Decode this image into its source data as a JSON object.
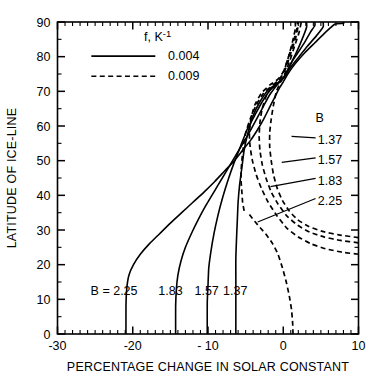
{
  "chart_data": {
    "type": "line",
    "title": "",
    "xlabel": "PERCENTAGE CHANGE IN SOLAR CONSTANT",
    "ylabel": "LATITUDE OF ICE-LINE",
    "xlim": [
      -30,
      10
    ],
    "ylim": [
      0,
      90
    ],
    "xticks": [
      -30,
      -20,
      -10,
      0,
      10
    ],
    "xtick_labels": [
      "-30",
      "-20",
      "- 10",
      "0",
      "10"
    ],
    "yticks": [
      0,
      10,
      20,
      30,
      40,
      50,
      60,
      70,
      80,
      90
    ],
    "ytick_labels": [
      "0",
      "10",
      "20",
      "30",
      "40",
      "50",
      "60",
      "70",
      "80",
      "90"
    ],
    "x_minor_step": 1,
    "y_minor_step": 5,
    "grid": false,
    "legend": {
      "position": "top-left-inside",
      "header": "f, K-1",
      "header_base": "f, K",
      "header_exponent": "-1",
      "entries": [
        {
          "label": "0.004",
          "style": "solid"
        },
        {
          "label": "0.009",
          "style": "dashed"
        }
      ]
    },
    "series": [
      {
        "name": "B = 2.25, f = 0.004",
        "B": "2.25",
        "f": "0.004",
        "style": "solid",
        "points": [
          [
            -20.9,
            0
          ],
          [
            -20.9,
            8
          ],
          [
            -20.8,
            13
          ],
          [
            -20.5,
            17
          ],
          [
            -19.9,
            20
          ],
          [
            -19.0,
            23
          ],
          [
            -17.8,
            26
          ],
          [
            -16.4,
            29
          ],
          [
            -15.0,
            32
          ],
          [
            -13.5,
            35
          ],
          [
            -12.0,
            38
          ],
          [
            -10.5,
            41
          ],
          [
            -9.1,
            44
          ],
          [
            -7.8,
            47
          ],
          [
            -6.5,
            50
          ],
          [
            -5.4,
            53
          ],
          [
            -4.3,
            56
          ],
          [
            -3.4,
            59
          ],
          [
            -2.6,
            62
          ],
          [
            -1.9,
            65
          ],
          [
            -1.2,
            68
          ],
          [
            -0.5,
            71
          ],
          [
            -0.05,
            72.5
          ],
          [
            0.6,
            75
          ],
          [
            1.6,
            78
          ],
          [
            2.8,
            81
          ],
          [
            4.2,
            84
          ],
          [
            5.6,
            87
          ],
          [
            6.9,
            89.4
          ],
          [
            8.0,
            89.6
          ],
          [
            8.0,
            90
          ]
        ]
      },
      {
        "name": "B = 1.83, f = 0.004",
        "B": "1.83",
        "f": "0.004",
        "style": "solid",
        "points": [
          [
            -14.3,
            0
          ],
          [
            -14.3,
            8
          ],
          [
            -14.2,
            13
          ],
          [
            -14.0,
            17
          ],
          [
            -13.6,
            21
          ],
          [
            -13.0,
            25
          ],
          [
            -12.2,
            29
          ],
          [
            -11.3,
            33
          ],
          [
            -10.3,
            37
          ],
          [
            -9.2,
            41
          ],
          [
            -8.1,
            45
          ],
          [
            -7.0,
            49
          ],
          [
            -5.9,
            53
          ],
          [
            -4.8,
            57
          ],
          [
            -3.8,
            61
          ],
          [
            -2.8,
            65
          ],
          [
            -1.8,
            69
          ],
          [
            -0.7,
            72.2
          ],
          [
            0.1,
            74
          ],
          [
            1.0,
            77
          ],
          [
            2.1,
            80
          ],
          [
            3.2,
            83
          ],
          [
            4.4,
            86
          ],
          [
            5.3,
            88.6
          ],
          [
            5.3,
            90
          ]
        ]
      },
      {
        "name": "B = 1.57, f = 0.004",
        "B": "1.57",
        "f": "0.004",
        "style": "solid",
        "points": [
          [
            -10.1,
            0
          ],
          [
            -10.1,
            9
          ],
          [
            -10.0,
            14
          ],
          [
            -9.9,
            19
          ],
          [
            -9.6,
            24
          ],
          [
            -9.2,
            29
          ],
          [
            -8.7,
            34
          ],
          [
            -8.1,
            39
          ],
          [
            -7.4,
            44
          ],
          [
            -6.6,
            49
          ],
          [
            -5.7,
            54
          ],
          [
            -4.8,
            59
          ],
          [
            -3.8,
            63
          ],
          [
            -2.8,
            67
          ],
          [
            -1.7,
            70.5
          ],
          [
            -0.6,
            72.4
          ],
          [
            0.2,
            74.5
          ],
          [
            1.0,
            78
          ],
          [
            1.9,
            81
          ],
          [
            2.8,
            84
          ],
          [
            3.6,
            87
          ],
          [
            4.2,
            89
          ],
          [
            4.2,
            90
          ]
        ]
      },
      {
        "name": "B = 1.37, f = 0.004",
        "B": "1.37",
        "f": "0.004",
        "style": "solid",
        "points": [
          [
            -6.3,
            0
          ],
          [
            -6.3,
            10
          ],
          [
            -6.3,
            16
          ],
          [
            -6.3,
            22
          ],
          [
            -6.2,
            28
          ],
          [
            -6.1,
            33
          ],
          [
            -6.0,
            38
          ],
          [
            -5.8,
            43
          ],
          [
            -5.5,
            48
          ],
          [
            -5.2,
            53
          ],
          [
            -4.7,
            58
          ],
          [
            -4.0,
            63
          ],
          [
            -3.1,
            67
          ],
          [
            -2.0,
            70.4
          ],
          [
            -0.8,
            72.3
          ],
          [
            0.2,
            74.4
          ],
          [
            0.9,
            77.5
          ],
          [
            1.7,
            81
          ],
          [
            2.5,
            85
          ],
          [
            3.1,
            88.5
          ],
          [
            3.1,
            90
          ]
        ]
      },
      {
        "name": "B = 1.37, f = 0.009",
        "B": "1.37",
        "f": "0.009",
        "style": "dashed",
        "points": [
          [
            -5.2,
            35.5
          ],
          [
            -5.4,
            38
          ],
          [
            -5.5,
            41
          ],
          [
            -5.6,
            44
          ],
          [
            -5.6,
            47
          ],
          [
            -5.5,
            50
          ],
          [
            -5.3,
            54
          ],
          [
            -5.0,
            58
          ],
          [
            -4.4,
            62
          ],
          [
            -3.6,
            66
          ],
          [
            -2.6,
            69.5
          ],
          [
            -1.4,
            71.8
          ],
          [
            -0.5,
            73.3
          ],
          [
            0.1,
            76
          ],
          [
            0.7,
            80
          ],
          [
            1.3,
            84
          ],
          [
            1.8,
            88
          ],
          [
            1.9,
            90
          ]
        ]
      },
      {
        "name": "B = 1.57, f = 0.009",
        "B": "1.57",
        "f": "0.009",
        "style": "dashed",
        "points": [
          [
            10.0,
            27.8
          ],
          [
            7.4,
            28.6
          ],
          [
            5.2,
            29.6
          ],
          [
            3.4,
            31
          ],
          [
            1.9,
            33
          ],
          [
            0.8,
            35.5
          ],
          [
            -0.1,
            38.5
          ],
          [
            -0.8,
            42
          ],
          [
            -1.3,
            46
          ],
          [
            -1.6,
            50
          ],
          [
            -1.8,
            54
          ],
          [
            -1.8,
            58
          ],
          [
            -1.6,
            62
          ],
          [
            -1.3,
            66
          ],
          [
            -0.9,
            70
          ],
          [
            -0.4,
            72.5
          ],
          [
            0.2,
            75
          ],
          [
            0.9,
            79
          ],
          [
            1.5,
            83
          ],
          [
            2.1,
            87
          ],
          [
            2.4,
            90
          ]
        ]
      },
      {
        "name": "B = 1.83, f = 0.009",
        "B": "1.83",
        "f": "0.009",
        "style": "dashed",
        "points": [
          [
            10.0,
            26.3
          ],
          [
            7.6,
            27.0
          ],
          [
            5.4,
            28.0
          ],
          [
            3.5,
            29.4
          ],
          [
            1.9,
            31.4
          ],
          [
            0.5,
            34
          ],
          [
            -0.7,
            37.5
          ],
          [
            -1.6,
            41
          ],
          [
            -2.3,
            45
          ],
          [
            -2.8,
            49
          ],
          [
            -3.1,
            53
          ],
          [
            -3.2,
            57
          ],
          [
            -3.1,
            61
          ],
          [
            -2.8,
            65
          ],
          [
            -2.2,
            69
          ],
          [
            -1.2,
            72
          ],
          [
            -0.3,
            74
          ],
          [
            0.4,
            77
          ],
          [
            1.0,
            81
          ],
          [
            1.6,
            85
          ],
          [
            2.0,
            89
          ],
          [
            2.0,
            90
          ]
        ]
      },
      {
        "name": "B = 2.25, f = 0.009",
        "B": "2.25",
        "f": "0.009",
        "style": "dashed",
        "points": [
          [
            10.0,
            23.0
          ],
          [
            7.8,
            23.6
          ],
          [
            5.6,
            24.6
          ],
          [
            3.7,
            26.0
          ],
          [
            2.0,
            28.0
          ],
          [
            0.5,
            30.5
          ],
          [
            -0.8,
            34
          ],
          [
            -2.0,
            38
          ],
          [
            -2.9,
            42
          ],
          [
            -3.6,
            46
          ],
          [
            -4.1,
            50
          ],
          [
            -4.4,
            54
          ],
          [
            -4.5,
            58
          ],
          [
            -4.3,
            62
          ],
          [
            -3.8,
            66
          ],
          [
            -2.9,
            69.5
          ],
          [
            -1.8,
            71.8
          ],
          [
            -0.7,
            73.5
          ],
          [
            0.1,
            76
          ],
          [
            0.7,
            80
          ],
          [
            1.2,
            84
          ],
          [
            1.6,
            88
          ],
          [
            1.6,
            90
          ]
        ]
      },
      {
        "name": "B = 2.25, f = 0.009 lower branch",
        "B": "2.25",
        "f": "0.009",
        "style": "dashed",
        "points": [
          [
            -4.5,
            34.5
          ],
          [
            -3.8,
            32.5
          ],
          [
            -3.0,
            30.5
          ],
          [
            -2.2,
            28.5
          ],
          [
            -1.4,
            26
          ],
          [
            -0.7,
            23
          ],
          [
            -0.1,
            19
          ],
          [
            0.4,
            15
          ],
          [
            0.8,
            11
          ],
          [
            1.1,
            7
          ],
          [
            1.25,
            3
          ],
          [
            1.3,
            0
          ]
        ]
      }
    ],
    "bottom_labels": [
      {
        "text": "B = 2.25",
        "x": -25.6,
        "y": 12.5
      },
      {
        "text": "1.83",
        "x": -16.6,
        "y": 12.5
      },
      {
        "text": "1.57",
        "x": -11.8,
        "y": 12.5
      },
      {
        "text": "1.37",
        "x": -8.0,
        "y": 12.5
      }
    ],
    "right_label_group": {
      "header": "B",
      "header_x": 4.3,
      "header_y": 62.5,
      "items": [
        {
          "text": "1.37",
          "label_x": 4.6,
          "label_y": 56.0,
          "leader_from": [
            4.3,
            56.6
          ],
          "leader_to": [
            1.1,
            57.0
          ]
        },
        {
          "text": "1.57",
          "label_x": 4.6,
          "label_y": 50.2,
          "leader_from": [
            4.3,
            50.8
          ],
          "leader_to": [
            -0.2,
            49.5
          ]
        },
        {
          "text": "1.83",
          "label_x": 4.6,
          "label_y": 44.3,
          "leader_from": [
            4.3,
            44.9
          ],
          "leader_to": [
            -1.7,
            42.5
          ]
        },
        {
          "text": "2.25",
          "label_x": 4.6,
          "label_y": 38.5,
          "leader_from": [
            4.3,
            39.1
          ],
          "leader_to": [
            -3.4,
            32.3
          ]
        }
      ]
    }
  }
}
